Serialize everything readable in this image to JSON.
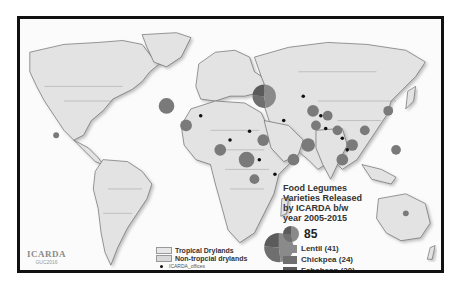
{
  "map": {
    "title": "Food Legumes Varieties Released by ICARDA b/w year 2005-2015",
    "title_lines": [
      "Food Legumes",
      "Varieties Released",
      "by ICARDA b/w",
      "year 2005-2015"
    ],
    "total_label": "85",
    "crops": [
      {
        "name": "Lentil",
        "count": 41,
        "label": "Lentil (41)",
        "color": "#8a8a8a"
      },
      {
        "name": "Chickpea",
        "count": 24,
        "label": "Chickpea (24)",
        "color": "#6f6f6f"
      },
      {
        "name": "Fababean",
        "count": 20,
        "label": "Fababean (20)",
        "color": "#5b5b5b"
      }
    ],
    "zones": [
      {
        "label": "Tropical Drylands",
        "color": "#e6e6e6"
      },
      {
        "label": "Non-tropcial drylands",
        "color": "#d9d9d9"
      }
    ],
    "offices_label": "ICARDA_offices",
    "logo": {
      "name": "ICARDA",
      "sub": "GUC2016"
    },
    "markers": [
      {
        "cx": 265,
        "cy": 95,
        "r": 12,
        "type": "pie"
      },
      {
        "cx": 280,
        "cy": 250,
        "r": 15,
        "type": "pie"
      },
      {
        "cx": 165,
        "cy": 105,
        "r": 8
      },
      {
        "cx": 247,
        "cy": 160,
        "r": 8
      },
      {
        "cx": 264,
        "cy": 140,
        "r": 6
      },
      {
        "cx": 220,
        "cy": 150,
        "r": 6
      },
      {
        "cx": 185,
        "cy": 125,
        "r": 6
      },
      {
        "cx": 310,
        "cy": 145,
        "r": 7
      },
      {
        "cx": 315,
        "cy": 110,
        "r": 6
      },
      {
        "cx": 330,
        "cy": 115,
        "r": 5
      },
      {
        "cx": 318,
        "cy": 125,
        "r": 5
      },
      {
        "cx": 355,
        "cy": 145,
        "r": 6
      },
      {
        "cx": 340,
        "cy": 130,
        "r": 5
      },
      {
        "cx": 392,
        "cy": 110,
        "r": 5
      },
      {
        "cx": 400,
        "cy": 150,
        "r": 5
      },
      {
        "cx": 368,
        "cy": 130,
        "r": 5
      },
      {
        "cx": 345,
        "cy": 160,
        "r": 6
      },
      {
        "cx": 295,
        "cy": 160,
        "r": 6
      },
      {
        "cx": 52,
        "cy": 135,
        "r": 3
      },
      {
        "cx": 410,
        "cy": 215,
        "r": 3
      },
      {
        "cx": 255,
        "cy": 180,
        "r": 5
      }
    ],
    "offices": [
      {
        "x": 200,
        "y": 115
      },
      {
        "x": 230,
        "y": 140
      },
      {
        "x": 250,
        "y": 131
      },
      {
        "x": 285,
        "y": 120
      },
      {
        "x": 305,
        "y": 95
      },
      {
        "x": 323,
        "y": 115
      },
      {
        "x": 328,
        "y": 128
      },
      {
        "x": 345,
        "y": 138
      },
      {
        "x": 350,
        "y": 150
      },
      {
        "x": 260,
        "y": 160
      },
      {
        "x": 276,
        "y": 175
      }
    ]
  }
}
